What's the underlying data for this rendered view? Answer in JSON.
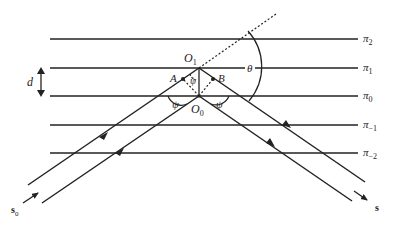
{
  "figure": {
    "type": "Bragg diffraction geometry",
    "planes": [
      {
        "label": "π",
        "sub": "2",
        "y": 39
      },
      {
        "label": "π",
        "sub": "1",
        "y": 68
      },
      {
        "label": "π",
        "sub": "0",
        "y": 96
      },
      {
        "label": "π",
        "sub": "−1",
        "y": 125
      },
      {
        "label": "π",
        "sub": "−2",
        "y": 153
      }
    ],
    "spacing_label": "d",
    "points": {
      "O1": {
        "label": "O",
        "sub": "1"
      },
      "O0": {
        "label": "O",
        "sub": "0"
      },
      "A": {
        "label": "A"
      },
      "B": {
        "label": "B"
      }
    },
    "angles": {
      "psi": "ψ",
      "theta": "θ"
    },
    "incident_vector": {
      "label": "s",
      "sub": "0"
    },
    "diffracted_vector": {
      "label": "s"
    }
  },
  "colors": {
    "line": "#222222",
    "background": "#ffffff"
  }
}
